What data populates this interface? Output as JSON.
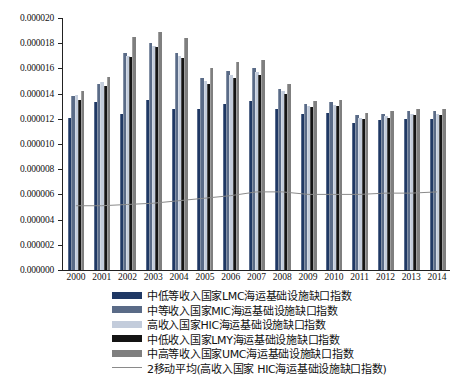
{
  "chart_data": {
    "type": "bar",
    "title": "",
    "xlabel": "",
    "ylabel": "",
    "ylim": [
      0,
      2e-05
    ],
    "ytick_labels": [
      "0.000020",
      "0.000018",
      "0.000016",
      "0.000014",
      "0.000012",
      "0.000010",
      "0.000008",
      "0.000006",
      "0.000004",
      "0.000002",
      "0.000000"
    ],
    "ytick_values": [
      2e-05,
      1.8e-05,
      1.6e-05,
      1.4e-05,
      1.2e-05,
      1e-05,
      8e-06,
      6e-06,
      4e-06,
      2e-06,
      0
    ],
    "grid": false,
    "legend_position": "bottom",
    "categories": [
      "2000",
      "2001",
      "2002",
      "2003",
      "2004",
      "2005",
      "2006",
      "2007",
      "2008",
      "2009",
      "2010",
      "2011",
      "2012",
      "2013",
      "2014"
    ],
    "series": [
      {
        "name": "中低等收入国家LMC海运基础设施缺口指数",
        "key": "LMC",
        "color": "#1f3864",
        "values": [
          1.21e-05,
          1.33e-05,
          1.24e-05,
          1.35e-05,
          1.28e-05,
          1.28e-05,
          1.32e-05,
          1.34e-05,
          1.28e-05,
          1.24e-05,
          1.25e-05,
          1.17e-05,
          1.19e-05,
          1.2e-05,
          1.2e-05
        ]
      },
      {
        "name": "中等收入国家MIC海运基础设施缺口指数",
        "key": "MIC",
        "color": "#5a6b87",
        "values": [
          1.38e-05,
          1.48e-05,
          1.72e-05,
          1.8e-05,
          1.72e-05,
          1.52e-05,
          1.58e-05,
          1.6e-05,
          1.44e-05,
          1.32e-05,
          1.33e-05,
          1.23e-05,
          1.24e-05,
          1.26e-05,
          1.26e-05
        ]
      },
      {
        "name": "高收入国家HIC海运基础设施缺口指数",
        "key": "HIC",
        "color": "#c3ccdb",
        "values": [
          1.39e-05,
          1.49e-05,
          1.7e-05,
          1.78e-05,
          1.7e-05,
          1.5e-05,
          1.55e-05,
          1.57e-05,
          1.42e-05,
          1.3e-05,
          1.31e-05,
          1.21e-05,
          1.22e-05,
          1.24e-05,
          1.24e-05
        ]
      },
      {
        "name": "中低收入国家LMY海运基础设施缺口指数",
        "key": "LMY",
        "color": "#141414",
        "values": [
          1.35e-05,
          1.46e-05,
          1.69e-05,
          1.77e-05,
          1.68e-05,
          1.48e-05,
          1.52e-05,
          1.55e-05,
          1.4e-05,
          1.29e-05,
          1.3e-05,
          1.2e-05,
          1.21e-05,
          1.23e-05,
          1.23e-05
        ]
      },
      {
        "name": "中高等收入国家UMC海运基础设施缺口指数",
        "key": "UMC",
        "color": "#7f7f7f",
        "values": [
          1.42e-05,
          1.53e-05,
          1.85e-05,
          1.89e-05,
          1.84e-05,
          1.6e-05,
          1.65e-05,
          1.67e-05,
          1.48e-05,
          1.34e-05,
          1.35e-05,
          1.25e-05,
          1.26e-05,
          1.28e-05,
          1.28e-05
        ]
      }
    ],
    "moving_average": {
      "name": "2移动平均(高收入国家 HIC海运基础设施缺口指数)",
      "color": "#8a8a8a",
      "values": [
        5.1e-06,
        5.1e-06,
        5.2e-06,
        5.3e-06,
        5.5e-06,
        5.7e-06,
        5.9e-06,
        6.2e-06,
        6.2e-06,
        6e-06,
        6e-06,
        6e-06,
        6.1e-06,
        6.1e-06,
        6.2e-06
      ]
    }
  },
  "legend": {
    "items": [
      {
        "label": "中低等收入国家LMC海运基础设施缺口指数",
        "type": "swatch",
        "color": "#1f3864"
      },
      {
        "label": "中等收入国家MIC海运基础设施缺口指数",
        "type": "swatch",
        "color": "#5a6b87"
      },
      {
        "label": "高收入国家HIC海运基础设施缺口指数",
        "type": "swatch",
        "color": "#c3ccdb"
      },
      {
        "label": "中低收入国家LMY海运基础设施缺口指数",
        "type": "swatch",
        "color": "#141414"
      },
      {
        "label": "中高等收入国家UMC海运基础设施缺口指数",
        "type": "swatch",
        "color": "#7f7f7f"
      },
      {
        "label": "2移动平均(高收入国家 HIC海运基础设施缺口指数)",
        "type": "line",
        "color": "#8a8a8a"
      }
    ]
  }
}
